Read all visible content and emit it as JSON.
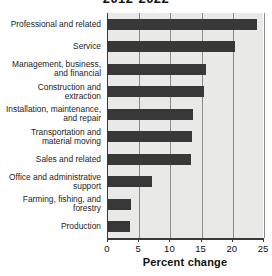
{
  "chart_data": {
    "type": "bar",
    "orientation": "horizontal",
    "title": "2012-2022",
    "xlabel": "Percent change",
    "ylabel": "",
    "xlim": [
      0,
      25
    ],
    "xticks": [
      0,
      5,
      10,
      15,
      20,
      25
    ],
    "grid": true,
    "legend": null,
    "categories": [
      "Professional and related",
      "Service",
      "Management, business, and financial",
      "Construction and extraction",
      "Installation, maintenance, and repair",
      "Transportation and material moving",
      "Sales and related",
      "Office and administrative support",
      "Farming, fishing, and forestry",
      "Production"
    ],
    "values": [
      23.8,
      20.4,
      15.7,
      15.4,
      13.7,
      13.4,
      13.3,
      7.1,
      3.7,
      3.5
    ],
    "bar_color": "#383838",
    "plot_background": "#e9e9e7"
  },
  "axis": {
    "tick_labels": [
      "0",
      "5",
      "10",
      "15",
      "20",
      "25"
    ],
    "title": "Percent change"
  },
  "categories_display": [
    [
      "Professional and related"
    ],
    [
      "Service"
    ],
    [
      "Management, business,",
      "and financial"
    ],
    [
      "Construction and",
      "extraction"
    ],
    [
      "Installation, maintenance,",
      "and repair"
    ],
    [
      "Transportation and",
      "material moving"
    ],
    [
      "Sales and related"
    ],
    [
      "Office and administrative",
      "support"
    ],
    [
      "Farming, fishing, and",
      "forestry"
    ],
    [
      "Production"
    ]
  ]
}
